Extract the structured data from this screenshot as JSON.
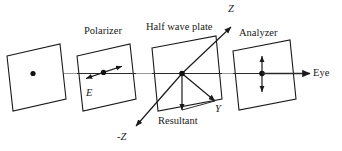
{
  "figure": {
    "type": "optics-ray-diagram",
    "stroke_color": "#1a1a1a",
    "axis_color": "#3a3a3a",
    "plane_fill": "#ffffff"
  },
  "labels": {
    "polarizer": "Polarizer",
    "half_wave_plate": "Half wave plate",
    "analyzer": "Analyzer",
    "eye": "Eye",
    "e_field": "E",
    "axis_z_positive": "Z",
    "axis_z_negative": "-Z",
    "axis_y": "Y",
    "resultant": "Resultant"
  },
  "elements": {
    "source_plane": {
      "name": "source-plane",
      "has_center_dot": true
    },
    "polarizer_plane": {
      "name": "polarizer-plane",
      "has_center_dot": true,
      "arrow": "double-headed-tilted"
    },
    "half_wave_plate_plane": {
      "name": "half-wave-plate-plane",
      "has_center_dot": true,
      "arrow": "diagonal-axes"
    },
    "analyzer_plane": {
      "name": "analyzer-plane",
      "has_center_dot": true,
      "arrow": "double-headed-vertical"
    },
    "optical_axis": {
      "name": "optical-axis",
      "direction": "left-to-right",
      "terminates_at": "Eye"
    }
  },
  "geometry": {
    "planes": [
      {
        "id": "source",
        "points": "7,56 60,44 66,99 13,111"
      },
      {
        "id": "polarizer",
        "points": "77,56 130,44 136,99 83,111"
      },
      {
        "id": "halfwave",
        "points": "152,48 216,36 222,99 158,111"
      },
      {
        "id": "analyzer",
        "points": "233,51 290,40 296,99 239,110"
      }
    ]
  }
}
